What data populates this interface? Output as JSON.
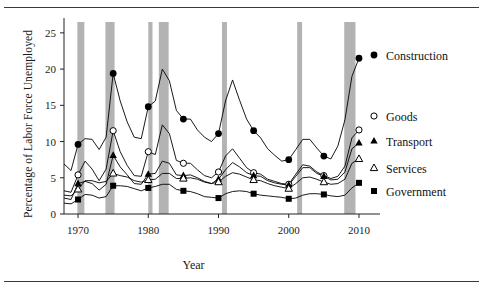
{
  "figure": {
    "ylabel": "Percentage of Labor Force Unemployed",
    "xlabel": "Year"
  },
  "chart_data": {
    "type": "line",
    "title": "",
    "xlabel": "Year",
    "ylabel": "Percentage of Labor Force Unemployed",
    "xlim": [
      1968,
      2011
    ],
    "ylim": [
      0,
      26.5
    ],
    "yticks": [
      0,
      5,
      10,
      15,
      20,
      25
    ],
    "xticks": [
      1970,
      1980,
      1990,
      2000,
      2010
    ],
    "xtick_labels": [
      "1970",
      "1980",
      "1990",
      "2000",
      "2010"
    ],
    "ytick_labels": [
      "0",
      "5",
      "10",
      "15",
      "20",
      "25"
    ],
    "grid": false,
    "legend_position": "right",
    "marker_years": [
      1970,
      1975,
      1980,
      1985,
      1990,
      1995,
      2000,
      2005,
      2010
    ],
    "recession_bands": [
      {
        "start": 1969.9,
        "end": 1970.9
      },
      {
        "start": 1973.9,
        "end": 1975.2
      },
      {
        "start": 1980.0,
        "end": 1980.6
      },
      {
        "start": 1981.5,
        "end": 1982.9
      },
      {
        "start": 1990.5,
        "end": 1991.2
      },
      {
        "start": 2001.2,
        "end": 2001.9
      },
      {
        "start": 2007.9,
        "end": 2009.5
      }
    ],
    "recession_color": "#b3b3b3",
    "series": [
      {
        "name": "Construction",
        "marker": "filled-circle",
        "color": "#000000",
        "x": [
          1968,
          1969,
          1970,
          1971,
          1972,
          1973,
          1974,
          1975,
          1976,
          1977,
          1978,
          1979,
          1980,
          1981,
          1982,
          1983,
          1984,
          1985,
          1986,
          1987,
          1988,
          1989,
          1990,
          1991,
          1992,
          1993,
          1994,
          1995,
          1996,
          1997,
          1998,
          1999,
          2000,
          2001,
          2002,
          2003,
          2004,
          2005,
          2006,
          2007,
          2008,
          2009,
          2010
        ],
        "values": [
          6.9,
          6.0,
          9.6,
          10.4,
          10.3,
          8.9,
          10.6,
          19.4,
          15.6,
          12.7,
          10.6,
          10.4,
          14.8,
          15.6,
          20.0,
          18.4,
          14.3,
          13.1,
          13.1,
          11.6,
          10.6,
          10.0,
          11.1,
          15.6,
          18.5,
          15.7,
          13.1,
          11.5,
          10.5,
          9.0,
          8.1,
          7.3,
          7.5,
          8.9,
          10.3,
          10.3,
          9.1,
          8.0,
          7.6,
          9.4,
          13.0,
          19.0,
          21.5
        ]
      },
      {
        "name": "Goods",
        "marker": "open-circle",
        "color": "#000000",
        "x": [
          1968,
          1969,
          1970,
          1971,
          1972,
          1973,
          1974,
          1975,
          1976,
          1977,
          1978,
          1979,
          1980,
          1981,
          1982,
          1983,
          1984,
          1985,
          1986,
          1987,
          1988,
          1989,
          1990,
          1991,
          1992,
          1993,
          1994,
          1995,
          1996,
          1997,
          1998,
          1999,
          2000,
          2001,
          2002,
          2003,
          2004,
          2005,
          2006,
          2007,
          2008,
          2009,
          2010
        ],
        "values": [
          3.2,
          3.0,
          5.4,
          7.3,
          6.2,
          4.6,
          6.2,
          11.5,
          8.6,
          6.7,
          5.3,
          5.2,
          8.6,
          8.2,
          12.3,
          11.1,
          7.4,
          7.0,
          7.0,
          6.1,
          5.3,
          5.0,
          5.8,
          8.0,
          9.0,
          7.7,
          6.4,
          5.7,
          5.5,
          4.8,
          4.5,
          4.2,
          4.1,
          5.5,
          6.8,
          6.6,
          5.8,
          5.3,
          4.9,
          5.2,
          6.6,
          10.5,
          11.6
        ]
      },
      {
        "name": "Transport",
        "marker": "filled-triangle",
        "color": "#000000",
        "x": [
          1968,
          1969,
          1970,
          1971,
          1972,
          1973,
          1974,
          1975,
          1976,
          1977,
          1978,
          1979,
          1980,
          1981,
          1982,
          1983,
          1984,
          1985,
          1986,
          1987,
          1988,
          1989,
          1990,
          1991,
          1992,
          1993,
          1994,
          1995,
          1996,
          1997,
          1998,
          1999,
          2000,
          2001,
          2002,
          2003,
          2004,
          2005,
          2006,
          2007,
          2008,
          2009,
          2010
        ],
        "values": [
          2.2,
          2.0,
          4.2,
          4.5,
          4.2,
          3.3,
          4.1,
          8.1,
          6.5,
          5.4,
          4.2,
          4.1,
          5.5,
          5.6,
          7.3,
          7.0,
          5.4,
          5.3,
          5.4,
          5.0,
          4.5,
          4.2,
          4.8,
          6.1,
          7.1,
          6.5,
          5.7,
          5.3,
          5.2,
          4.6,
          4.3,
          4.1,
          4.0,
          5.2,
          6.4,
          6.4,
          5.6,
          5.2,
          4.7,
          4.8,
          5.8,
          9.0,
          9.8
        ]
      },
      {
        "name": "Services",
        "marker": "open-triangle",
        "color": "#000000",
        "x": [
          1968,
          1969,
          1970,
          1971,
          1972,
          1973,
          1974,
          1975,
          1976,
          1977,
          1978,
          1979,
          1980,
          1981,
          1982,
          1983,
          1984,
          1985,
          1986,
          1987,
          1988,
          1989,
          1990,
          1991,
          1992,
          1993,
          1994,
          1995,
          1996,
          1997,
          1998,
          1999,
          2000,
          2001,
          2002,
          2003,
          2004,
          2005,
          2006,
          2007,
          2008,
          2009,
          2010
        ],
        "values": [
          2.6,
          2.5,
          3.4,
          4.6,
          4.6,
          4.3,
          4.5,
          5.6,
          5.3,
          5.1,
          4.6,
          4.4,
          4.7,
          4.8,
          5.6,
          5.6,
          4.9,
          4.9,
          5.0,
          4.8,
          4.4,
          4.2,
          4.4,
          5.2,
          5.7,
          5.5,
          5.1,
          4.7,
          4.6,
          4.2,
          3.9,
          3.7,
          3.5,
          4.2,
          5.0,
          5.1,
          4.8,
          4.4,
          4.1,
          4.2,
          4.8,
          7.0,
          7.6
        ]
      },
      {
        "name": "Government",
        "marker": "filled-square",
        "color": "#000000",
        "x": [
          1968,
          1969,
          1970,
          1971,
          1972,
          1973,
          1974,
          1975,
          1976,
          1977,
          1978,
          1979,
          1980,
          1981,
          1982,
          1983,
          1984,
          1985,
          1986,
          1987,
          1988,
          1989,
          1990,
          1991,
          1992,
          1993,
          1994,
          1995,
          1996,
          1997,
          1998,
          1999,
          2000,
          2001,
          2002,
          2003,
          2004,
          2005,
          2006,
          2007,
          2008,
          2009,
          2010
        ],
        "values": [
          1.5,
          1.4,
          2.0,
          2.7,
          2.6,
          2.2,
          2.4,
          3.9,
          3.9,
          3.8,
          3.5,
          3.2,
          3.6,
          3.8,
          4.1,
          4.1,
          3.4,
          3.2,
          3.1,
          2.8,
          2.4,
          2.3,
          2.2,
          2.8,
          3.1,
          3.2,
          3.1,
          2.8,
          2.6,
          2.5,
          2.4,
          2.3,
          2.1,
          2.2,
          2.6,
          2.8,
          2.8,
          2.7,
          2.5,
          2.4,
          2.6,
          3.6,
          4.3
        ]
      }
    ]
  }
}
